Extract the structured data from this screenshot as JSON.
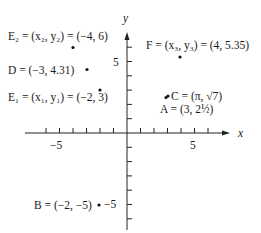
{
  "axes": {
    "x_label": "x",
    "y_label": "y",
    "x_tick_label_neg": "−5",
    "x_tick_label_pos": "5",
    "y_tick_label_pos": "5",
    "y_tick_label_neg": "−5",
    "x_range": [
      -6,
      6
    ],
    "y_range": [
      -6,
      7
    ]
  },
  "points": [
    {
      "name": "E2",
      "label": "E₂ = (x₂, y₂) = (−4, 6)",
      "x": -4,
      "y": 6
    },
    {
      "name": "D",
      "label": "D = (−3, 4.31)",
      "x": -3,
      "y": 4.31
    },
    {
      "name": "E1",
      "label": "E₁ = (x₁, y₁) = (−2, 3)",
      "x": -2,
      "y": 3
    },
    {
      "name": "F",
      "label": "F = (x₃, y₃) = (4, 5.35)",
      "x": 4,
      "y": 5.35
    },
    {
      "name": "C",
      "label": "C = (π, √7)",
      "x": 3.14159,
      "y": 2.6458
    },
    {
      "name": "A",
      "label": "A = (3, 2½)",
      "x": 3,
      "y": 2.5
    },
    {
      "name": "B",
      "label": "B = (−2, −5)",
      "x": -2,
      "y": -5
    }
  ]
}
